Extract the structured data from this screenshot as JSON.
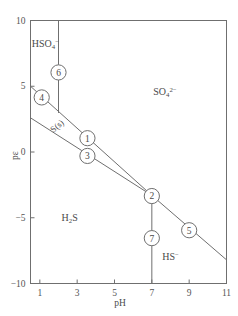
{
  "figure": {
    "type": "pe-pH predominance diagram",
    "background": "#ffffff",
    "line_color": "#6f6f6f",
    "text_color": "#4a4a4a"
  },
  "axes": {
    "x": {
      "label": "pH",
      "min": 0.5,
      "max": 11,
      "ticks": [
        1,
        3,
        5,
        7,
        9,
        11
      ],
      "tick_labels": [
        "1",
        "3",
        "5",
        "7",
        "9",
        "11"
      ]
    },
    "y": {
      "label": "pε",
      "min": -10,
      "max": 10,
      "ticks": [
        10,
        5,
        0,
        -5,
        -10
      ],
      "tick_labels": [
        "10",
        "5",
        "0",
        "−5",
        "−10"
      ]
    }
  },
  "species_labels": [
    {
      "id": "hso4",
      "html": "HSO<sub>4</sub><sup>−</sup>",
      "pH": 1.3,
      "pe": 8.2
    },
    {
      "id": "so4",
      "html": "SO<sub>4</sub><sup>2−</sup>",
      "pH": 7.7,
      "pe": 4.6
    },
    {
      "id": "s-solid",
      "html": "S(s)",
      "pH": 1.9,
      "pe": 2.0
    },
    {
      "id": "h2s",
      "html": "H<sub>2</sub>S",
      "pH": 2.6,
      "pe": -5.0
    },
    {
      "id": "hs",
      "html": "HS<sup>−</sup>",
      "pH": 8.0,
      "pe": -7.9
    }
  ],
  "boundary_lines": [
    {
      "id": "line-hso4-so4-vertical",
      "points": [
        [
          2,
          10
        ],
        [
          2,
          3.0
        ]
      ]
    },
    {
      "id": "line-upper-so4-s-hs",
      "points": [
        [
          0.5,
          5.0
        ],
        [
          7,
          -3.3
        ],
        [
          11,
          -8.2
        ]
      ]
    },
    {
      "id": "line-lower-s-h2s",
      "points": [
        [
          0.5,
          2.6
        ],
        [
          7,
          -3.3
        ]
      ]
    },
    {
      "id": "line-h2s-hs-vertical",
      "points": [
        [
          7,
          -3.3
        ],
        [
          7,
          -10
        ]
      ]
    }
  ],
  "markers": [
    {
      "label": "1",
      "pH": 3.55,
      "pe": 1.05
    },
    {
      "label": "2",
      "pH": 7.0,
      "pe": -3.35
    },
    {
      "label": "3",
      "pH": 3.55,
      "pe": -0.3
    },
    {
      "label": "4",
      "pH": 1.1,
      "pe": 4.15
    },
    {
      "label": "5",
      "pH": 9.0,
      "pe": -5.95
    },
    {
      "label": "6",
      "pH": 2.0,
      "pe": 6.05
    },
    {
      "label": "7",
      "pH": 7.0,
      "pe": -6.55
    }
  ]
}
